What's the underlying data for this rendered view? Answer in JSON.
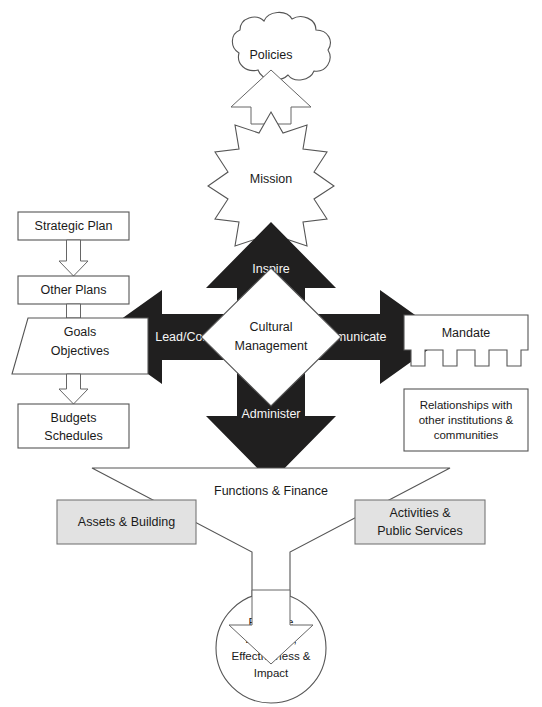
{
  "diagram": {
    "colors": {
      "solid_arrow": "#201f1f",
      "outline_stroke": "#555555",
      "gray_fill": "#e2e2e2",
      "background": "#ffffff",
      "label_on_dark": "#f6f6f6"
    },
    "nodes": {
      "policies": {
        "label": "Policies",
        "shape": "cloud"
      },
      "mission": {
        "label": "Mission",
        "shape": "starburst-12-point"
      },
      "center": {
        "label_line1": "Cultural",
        "label_line2": "Management",
        "shape": "diamond"
      },
      "inspire": {
        "label": "Inspire",
        "shape": "solid-arrow-up"
      },
      "administer": {
        "label": "Administer",
        "shape": "solid-arrow-down"
      },
      "lead_control": {
        "label": "Lead/Control",
        "shape": "solid-arrow-left"
      },
      "communicate": {
        "label": "Communicate",
        "shape": "solid-arrow-right"
      },
      "strategic_plan": {
        "label": "Strategic Plan",
        "shape": "rectangle"
      },
      "other_plans": {
        "label": "Other Plans",
        "shape": "rectangle"
      },
      "goals_objectives": {
        "label_line1": "Goals",
        "label_line2": "Objectives",
        "shape": "trapezoid"
      },
      "budgets_schedules": {
        "label_line1": "Budgets",
        "label_line2": "Schedules",
        "shape": "rectangle"
      },
      "mandate": {
        "label": "Mandate",
        "shape": "comb-rectangle",
        "teeth": 5
      },
      "relationships": {
        "label_line1": "Relationships with",
        "label_line2": "other institutions &",
        "label_line3": "communities",
        "shape": "rectangle"
      },
      "functions_finance": {
        "label": "Functions & Finance",
        "shape": "funnel-arrow"
      },
      "assets_building": {
        "label": "Assets & Building",
        "shape": "rectangle-gray"
      },
      "activities_public_services": {
        "label_line1": "Activities &",
        "label_line2": "Public Services",
        "shape": "rectangle-gray"
      },
      "evaluate": {
        "label_line1": "Evaluate",
        "label_line2": "Efficiency,",
        "label_line3": "Effectiveness &",
        "label_line4": "Impact",
        "shape": "circle"
      }
    },
    "connectors": {
      "mission_to_policies": "hollow-arrow-up",
      "strategic_to_other_plans": "hollow-arrow-down",
      "other_plans_to_goals": "hollow-arrow-down",
      "goals_to_budgets": "hollow-arrow-down",
      "funnel_to_evaluate": "hollow-arrow-down"
    }
  }
}
